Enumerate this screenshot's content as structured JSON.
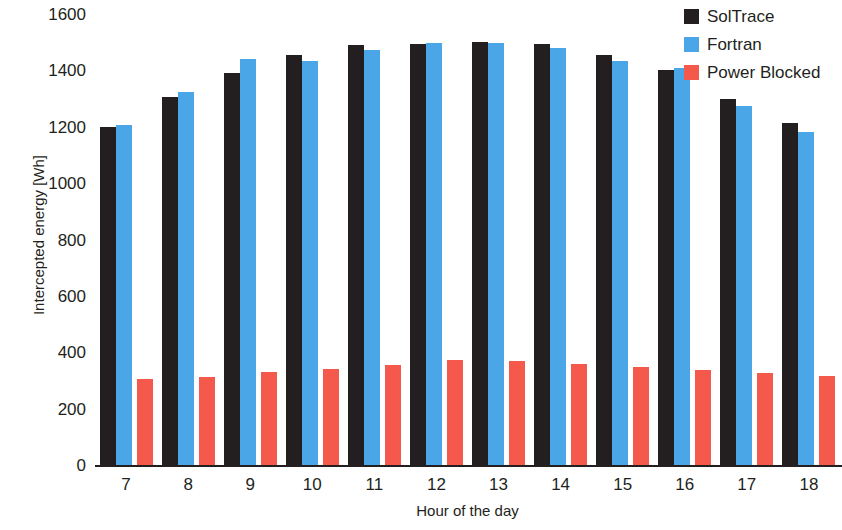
{
  "chart_data": {
    "type": "bar",
    "title": "",
    "xlabel": "Hour of the day",
    "ylabel": "Intercepted energy [Wh]",
    "categories": [
      "7",
      "8",
      "9",
      "10",
      "11",
      "12",
      "13",
      "14",
      "15",
      "16",
      "17",
      "18"
    ],
    "series": [
      {
        "name": "SolTrace",
        "color": "#231f20",
        "values": [
          1198,
          1305,
          1390,
          1455,
          1490,
          1495,
          1500,
          1495,
          1455,
          1400,
          1300,
          1215
        ]
      },
      {
        "name": "Fortran",
        "color": "#4ba6e8",
        "values": [
          1205,
          1325,
          1440,
          1432,
          1472,
          1497,
          1498,
          1478,
          1435,
          1410,
          1272,
          1182
        ]
      },
      {
        "name": "Power Blocked",
        "color": "#f4594b",
        "values": [
          305,
          312,
          330,
          340,
          355,
          372,
          370,
          360,
          348,
          337,
          325,
          315
        ]
      }
    ],
    "ylim": [
      0,
      1600
    ],
    "yticks": [
      1600,
      1400,
      1200,
      1000,
      800,
      600,
      400,
      200,
      0
    ],
    "grid": false,
    "legend_position": "top-right"
  },
  "axes": {
    "y_label": "Intercepted energy [Wh]",
    "x_label": "Hour of the day"
  },
  "legend": {
    "items": [
      {
        "label": "SolTrace",
        "color": "#231f20"
      },
      {
        "label": "Fortran",
        "color": "#4ba6e8"
      },
      {
        "label": "Power Blocked",
        "color": "#f4594b"
      }
    ]
  }
}
